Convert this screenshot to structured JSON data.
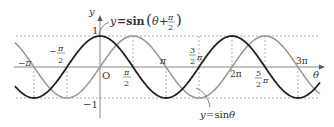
{
  "chart_data": {
    "type": "line",
    "title": "",
    "xlabel": "θ",
    "ylabel": "y",
    "xlim": [
      -4.75,
      10.2
    ],
    "ylim": [
      -1,
      1
    ],
    "grid": false,
    "series": [
      {
        "name": "y=sin(θ+π/2)",
        "function": "sin(theta + pi/2)",
        "color": "#222222",
        "stroke": "dark"
      },
      {
        "name": "y=sin θ",
        "function": "sin(theta)",
        "color": "#9a9a9a",
        "stroke": "light"
      }
    ],
    "x_tick_labels": [
      "-π",
      "-π/2",
      "O",
      "π/2",
      "π",
      "3/2 π",
      "2π",
      "5/2 π",
      "3π"
    ],
    "x_tick_values": [
      -3.1416,
      -1.5708,
      0,
      1.5708,
      3.1416,
      4.7124,
      6.2832,
      7.854,
      9.4248
    ],
    "y_tick_labels": [
      "1",
      "-1"
    ],
    "y_tick_values": [
      1,
      -1
    ],
    "annotations": [
      {
        "text": "y=sin(θ+π/2)",
        "target": "dark curve near θ=0"
      },
      {
        "text": "y=sin θ",
        "target": "light curve near θ=3π/2"
      }
    ],
    "reference_lines": [
      "dashed horizontal at y=1",
      "dashed horizontal at y=-1",
      "dashed verticals at multiples of π/2"
    ]
  },
  "labels": {
    "y_axis": "y",
    "x_axis": "θ",
    "origin": "O",
    "one": "1",
    "minus_one": "−1",
    "minus_pi": "−π",
    "minus_half_pi_num": "π",
    "minus_half_pi_den": "2",
    "minus_sign": "−",
    "half_pi_num": "π",
    "half_pi_den": "2",
    "pi": "π",
    "three_half_num": "3",
    "three_half_den": "2",
    "three_half_pi": "π",
    "two_pi": "2π",
    "five_half_num": "5",
    "five_half_den": "2",
    "five_half_pi": "π",
    "three_pi": "3π",
    "curve1_a": "y",
    "curve1_b": "=sin",
    "curve1_theta": "θ",
    "curve1_plus": "+",
    "curve1_num": "π",
    "curve1_den": "2",
    "curve2_a": "y",
    "curve2_b": "=sin ",
    "curve2_theta": "θ"
  }
}
